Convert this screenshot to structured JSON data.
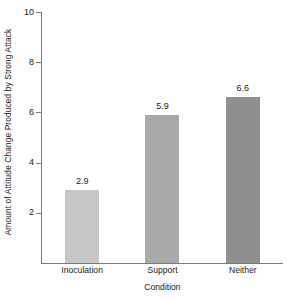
{
  "chart_data": {
    "type": "bar",
    "title": "",
    "subtitle": "",
    "xlabel": "Condition",
    "ylabel": "Amount of Attitude Change Produced by Strong Attack",
    "categories": [
      "Inoculation",
      "Support",
      "Neither"
    ],
    "values": [
      2.9,
      5.9,
      6.6
    ],
    "value_labels": [
      "2.9",
      "5.9",
      "6.6"
    ],
    "ylim": [
      0,
      10
    ],
    "yticks": [
      2,
      4,
      6,
      8,
      10
    ],
    "ytick_labels": [
      "2",
      "4",
      "6",
      "8",
      "10"
    ],
    "grid": false,
    "legend": false,
    "legend_position": "none",
    "bar_colors": [
      "#c6c6c6",
      "#a9a9a9",
      "#8f8f8f"
    ],
    "axis_color": "#7a7a7a",
    "text_color": "#1a1a1a",
    "background": "#ffffff"
  }
}
